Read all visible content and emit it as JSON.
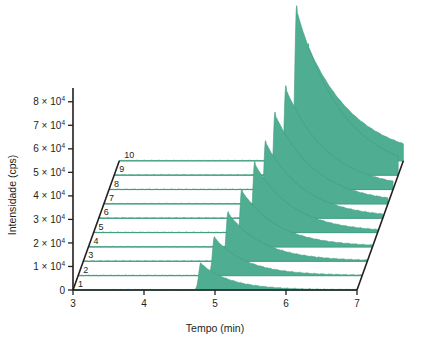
{
  "chart_data": {
    "type": "area",
    "title": "",
    "subtitle": "",
    "xlabel": "Tempo (min)",
    "ylabel": "Intensidade (cps)",
    "xlim": [
      3,
      7
    ],
    "ylim": [
      0,
      85000
    ],
    "xticks": [
      3,
      4,
      5,
      6,
      7
    ],
    "xticklabels": [
      "3",
      "4",
      "5",
      "6",
      "7"
    ],
    "yticks": [
      0,
      10000,
      20000,
      30000,
      40000,
      50000,
      60000,
      70000,
      80000
    ],
    "yticklabels": [
      "0",
      "1 × 10",
      "2 × 10",
      "3 × 10",
      "4 × 10",
      "5 × 10",
      "6 × 10",
      "7 × 10",
      "8 × 10"
    ],
    "y_exponent": "4",
    "grid": false,
    "legend_position": "none",
    "projection": "3d-waterfall",
    "depth_axis_labels": [
      "1",
      "2",
      "3",
      "4",
      "5",
      "6",
      "7",
      "8",
      "9",
      "10"
    ],
    "trace_color": "#4fae91",
    "trace_line_color": "#3f9c80",
    "axis_color": "#231f20",
    "series": [
      {
        "name": "1",
        "retention_time": 4.8,
        "peak_height": 11500,
        "tail": 0.42,
        "width": 0.028
      },
      {
        "name": "2",
        "retention_time": 4.92,
        "peak_height": 16500,
        "tail": 0.46,
        "width": 0.028
      },
      {
        "name": "3",
        "retention_time": 5.04,
        "peak_height": 21000,
        "tail": 0.5,
        "width": 0.028
      },
      {
        "name": "4",
        "retention_time": 5.16,
        "peak_height": 24500,
        "tail": 0.52,
        "width": 0.027
      },
      {
        "name": "5",
        "retention_time": 5.27,
        "peak_height": 30000,
        "tail": 0.54,
        "width": 0.027
      },
      {
        "name": "6",
        "retention_time": 5.35,
        "peak_height": 33000,
        "tail": 0.56,
        "width": 0.026
      },
      {
        "name": "7",
        "retention_time": 5.41,
        "peak_height": 39000,
        "tail": 0.58,
        "width": 0.026
      },
      {
        "name": "8",
        "retention_time": 5.49,
        "peak_height": 44000,
        "tail": 0.6,
        "width": 0.026
      },
      {
        "name": "9",
        "retention_time": 5.57,
        "peak_height": 72000,
        "tail": 0.66,
        "width": 0.027
      },
      {
        "name": "10",
        "retention_time": 5.66,
        "peak_height": 50000,
        "tail": 0.7,
        "width": 0.028
      }
    ],
    "secondary_peaks": [
      {
        "series": "9",
        "retention_time": 5.97,
        "peak_height": 11000,
        "tail": 0.16,
        "width": 0.022
      },
      {
        "series": "10",
        "retention_time": 6.02,
        "peak_height": 9000,
        "tail": 0.16,
        "width": 0.022
      }
    ]
  }
}
